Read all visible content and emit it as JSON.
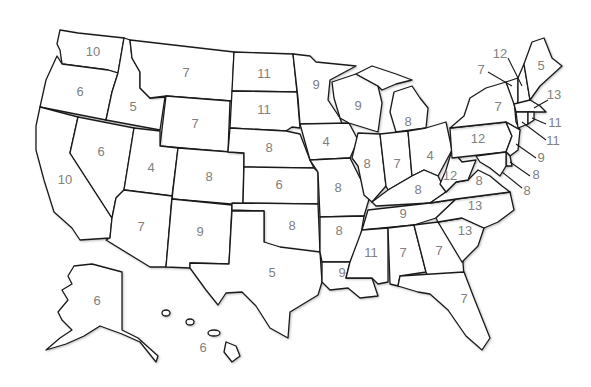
{
  "map": {
    "type": "choropleth-style labeled US map",
    "label_color": "#808080",
    "outline_color": "#1a1a1a",
    "background": "#ffffff"
  },
  "states": {
    "WA": {
      "name": "Washington",
      "value": "10"
    },
    "OR": {
      "name": "Oregon",
      "value": "6"
    },
    "CA": {
      "name": "California",
      "value": "10"
    },
    "ID": {
      "name": "Idaho",
      "value": "5"
    },
    "NV": {
      "name": "Nevada",
      "value": "6"
    },
    "MT": {
      "name": "Montana",
      "value": "7"
    },
    "WY": {
      "name": "Wyoming",
      "value": "7"
    },
    "UT": {
      "name": "Utah",
      "value": "4"
    },
    "CO": {
      "name": "Colorado",
      "value": "8"
    },
    "AZ": {
      "name": "Arizona",
      "value": "7"
    },
    "NM": {
      "name": "New Mexico",
      "value": "9"
    },
    "ND": {
      "name": "North Dakota",
      "value": "11"
    },
    "SD": {
      "name": "South Dakota",
      "value": "11"
    },
    "NE": {
      "name": "Nebraska",
      "value": "8"
    },
    "KS": {
      "name": "Kansas",
      "value": "6"
    },
    "OK": {
      "name": "Oklahoma",
      "value": "8"
    },
    "TX": {
      "name": "Texas",
      "value": "5"
    },
    "MN": {
      "name": "Minnesota",
      "value": "9"
    },
    "IA": {
      "name": "Iowa",
      "value": "4"
    },
    "MO": {
      "name": "Missouri",
      "value": "8"
    },
    "AR": {
      "name": "Arkansas",
      "value": "8"
    },
    "LA": {
      "name": "Louisiana",
      "value": "9"
    },
    "WI": {
      "name": "Wisconsin",
      "value": "9"
    },
    "IL": {
      "name": "Illinois",
      "value": "8"
    },
    "MI": {
      "name": "Michigan",
      "value": "8"
    },
    "IN": {
      "name": "Indiana",
      "value": "7"
    },
    "OH": {
      "name": "Ohio",
      "value": "4"
    },
    "KY": {
      "name": "Kentucky",
      "value": "8"
    },
    "TN": {
      "name": "Tennessee",
      "value": "9"
    },
    "MS": {
      "name": "Mississippi",
      "value": "11"
    },
    "AL": {
      "name": "Alabama",
      "value": "7"
    },
    "GA": {
      "name": "Georgia",
      "value": "7"
    },
    "FL": {
      "name": "Florida",
      "value": "7"
    },
    "SC": {
      "name": "South Carolina",
      "value": "13"
    },
    "NC": {
      "name": "North Carolina",
      "value": "13"
    },
    "VA": {
      "name": "Virginia",
      "value": "8"
    },
    "WV": {
      "name": "West Virginia",
      "value": "12"
    },
    "PA": {
      "name": "Pennsylvania",
      "value": "12"
    },
    "NY": {
      "name": "New York",
      "value": "7"
    },
    "VT": {
      "name": "Vermont",
      "value": "7"
    },
    "NH": {
      "name": "New Hampshire",
      "value": "12"
    },
    "ME": {
      "name": "Maine",
      "value": "5"
    },
    "MA": {
      "name": "Massachusetts",
      "value": "13"
    },
    "RI": {
      "name": "Rhode Island",
      "value": "11"
    },
    "CT": {
      "name": "Connecticut",
      "value": "11"
    },
    "NJ": {
      "name": "New Jersey",
      "value": "9"
    },
    "DE": {
      "name": "Delaware",
      "value": "8"
    },
    "MD": {
      "name": "Maryland",
      "value": "8"
    },
    "AK": {
      "name": "Alaska",
      "value": "6"
    },
    "HI": {
      "name": "Hawaii",
      "value": "6"
    }
  }
}
